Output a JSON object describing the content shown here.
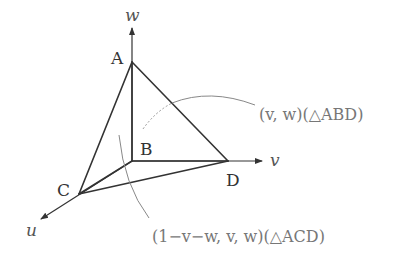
{
  "diagram": {
    "axes": {
      "w": {
        "label": "w",
        "from": [
          132,
          161
        ],
        "to": [
          132,
          27
        ]
      },
      "v": {
        "label": "v",
        "from": [
          132,
          161
        ],
        "to": [
          262,
          161
        ]
      },
      "u": {
        "label": "u",
        "from": [
          79,
          194
        ],
        "to": [
          41,
          219
        ]
      }
    },
    "points": {
      "A": {
        "label": "A",
        "x": 132,
        "y": 62
      },
      "B": {
        "label": "B",
        "x": 132,
        "y": 161
      },
      "C": {
        "label": "C",
        "x": 79,
        "y": 194
      },
      "D": {
        "label": "D",
        "x": 228,
        "y": 161
      }
    },
    "edges": [
      "AB",
      "AC",
      "AD",
      "BC",
      "BD",
      "CD"
    ],
    "annotations": {
      "abd": "(v, w)(△ABD)",
      "acd": "(1−v−w, v, w)(△ACD)"
    },
    "colors": {
      "edge": "#333333",
      "annotation": "#777777",
      "leader": "#888888"
    }
  }
}
